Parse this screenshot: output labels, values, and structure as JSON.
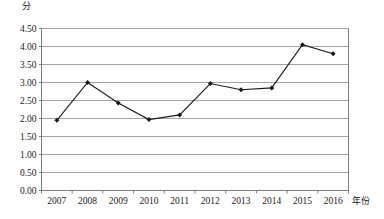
{
  "chart_data": {
    "type": "line",
    "title": "",
    "xlabel": "年份",
    "ylabel": "分",
    "categories": [
      "2007",
      "2008",
      "2009",
      "2010",
      "2011",
      "2012",
      "2013",
      "2014",
      "2015",
      "2016"
    ],
    "values": [
      1.95,
      3.0,
      2.43,
      1.97,
      2.1,
      2.97,
      2.8,
      2.85,
      4.05,
      3.8
    ],
    "series": [
      {
        "name": "分",
        "values": [
          1.95,
          3.0,
          2.43,
          1.97,
          2.1,
          2.97,
          2.8,
          2.85,
          4.05,
          3.8
        ]
      }
    ],
    "ylim": [
      0.0,
      4.5
    ],
    "ytick_values": [
      0.0,
      0.5,
      1.0,
      1.5,
      2.0,
      2.5,
      3.0,
      3.5,
      4.0,
      4.5
    ],
    "ytick_labels": [
      "0.00",
      "0.50",
      "1.00",
      "1.50",
      "2.00",
      "2.50",
      "3.00",
      "3.50",
      "4.00",
      "4.50"
    ],
    "grid": true,
    "grid_axis": "y",
    "legend": false,
    "legend_position": "none",
    "line_color": "#1a1a1a",
    "marker": "diamond",
    "marker_color": "#1a1a1a",
    "grid_color": "#9a9a9a",
    "axis_color": "#6e6e6e",
    "plot_background": "#ffffff"
  },
  "axes": {
    "y_unit": "分",
    "x_unit": "年份"
  }
}
